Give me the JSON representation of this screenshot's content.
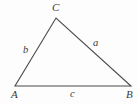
{
  "figure": {
    "type": "geometry-diagram",
    "shape": "triangle",
    "background_color": "#fdfdfd",
    "stroke_color": "#4a4a4a",
    "label_color": "#3a3a3a",
    "vertices": [
      {
        "name": "A",
        "label": "A",
        "x": 15,
        "y": 86,
        "label_x": 11,
        "label_y": 89
      },
      {
        "name": "B",
        "label": "B",
        "x": 131,
        "y": 86,
        "label_x": 126,
        "label_y": 89
      },
      {
        "name": "C",
        "label": "C",
        "x": 56,
        "y": 18,
        "label_x": 52,
        "label_y": 2
      }
    ],
    "sides": [
      {
        "name": "side-a",
        "label": "a",
        "between": "C-B",
        "label_x": 93,
        "label_y": 38
      },
      {
        "name": "side-b",
        "label": "b",
        "between": "A-C",
        "label_x": 23,
        "label_y": 45
      },
      {
        "name": "side-c",
        "label": "c",
        "between": "A-B",
        "label_x": 70,
        "label_y": 89
      }
    ]
  }
}
